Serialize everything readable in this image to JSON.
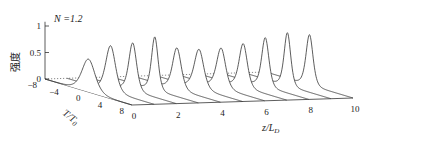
{
  "chart_data": {
    "type": "line",
    "subtype": "3d-waterfall",
    "title": "",
    "annotation": "N =1.2",
    "zlabel": "强度",
    "xlabel": "z/L_D",
    "ylabel": "T/T_0",
    "z_ticks": [
      "0",
      "0.5",
      "1"
    ],
    "t_ticks": [
      "-8",
      "-4",
      "0",
      "4",
      "8"
    ],
    "x_ticks": [
      "0",
      "2",
      "4",
      "6",
      "8",
      "10"
    ],
    "xlim": [
      0,
      10
    ],
    "tlim": [
      -8,
      8
    ],
    "zlim": [
      0,
      1
    ],
    "grid": false,
    "series_positions_z": [
      0,
      1,
      2,
      3,
      4,
      5,
      6,
      7,
      8,
      9,
      10
    ],
    "peak_intensity": [
      0.62,
      0.86,
      0.9,
      1.0,
      0.78,
      0.74,
      0.75,
      0.82,
      0.92,
      1.0,
      0.95
    ],
    "pulse_width": [
      1.6,
      1.2,
      0.95,
      0.8,
      1.05,
      1.15,
      1.1,
      1.0,
      0.88,
      0.8,
      0.85
    ],
    "line_color": "#333333",
    "baseline_style": "dotted"
  },
  "labels": {
    "annotation": "N =1.2",
    "zlabel": "强度",
    "xlabel_main": "z/L",
    "xlabel_sub": "D",
    "ylabel_main": "T/T",
    "ylabel_sub": "0"
  }
}
